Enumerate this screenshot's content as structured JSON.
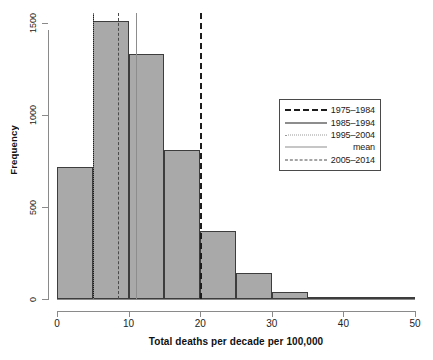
{
  "chart_data": {
    "type": "bar",
    "title": "",
    "subtitle": "",
    "xlabel": "Total deaths per decade per 100,000",
    "ylabel": "Frequency",
    "xlim": [
      0,
      50
    ],
    "ylim": [
      0,
      1550
    ],
    "grid": false,
    "bin_width": 5,
    "bin_edges": [
      0,
      5,
      10,
      15,
      20,
      25,
      30,
      35,
      40,
      45,
      50
    ],
    "categories": [
      "0-5",
      "5-10",
      "10-15",
      "15-20",
      "20-25",
      "25-30",
      "30-35",
      "35-40",
      "40-45",
      "45-50"
    ],
    "values": [
      720,
      1510,
      1330,
      810,
      370,
      140,
      40,
      12,
      4,
      1
    ],
    "bar_fill": "#a9a9a9",
    "bar_border": "#3d3d3d",
    "xticks": [
      0,
      10,
      20,
      30,
      40,
      50
    ],
    "xtick_labels": [
      "0",
      "10",
      "20",
      "30",
      "40",
      "50"
    ],
    "yticks": [
      0,
      500,
      1000,
      1500
    ],
    "ytick_labels": [
      "0",
      "500",
      "1000",
      "1500"
    ],
    "vlines": [
      {
        "name": "1975-1984",
        "x": 20.0,
        "style": "dashed-thick",
        "color": "#1c1c1c"
      },
      {
        "name": "1985-1994",
        "x": 5.0,
        "style": "solid-thick",
        "color": "#1c1c1c"
      },
      {
        "name": "1995-2004",
        "x": 5.0,
        "style": "dotted",
        "color": "#7a7a7a"
      },
      {
        "name": "mean",
        "x": 11.0,
        "style": "solid-thin",
        "color": "#8d8d8d"
      },
      {
        "name": "2005-2014",
        "x": 8.5,
        "style": "dashed-thin",
        "color": "#4a4a4a"
      }
    ],
    "legend_position": "center-right",
    "legend": [
      {
        "label": "1975–1984",
        "key": "dashed-thick"
      },
      {
        "label": "1985–1994",
        "key": "solid-thick"
      },
      {
        "label": "1995–2004",
        "key": "dotted"
      },
      {
        "label": "mean",
        "key": "solid-thin"
      },
      {
        "label": "2005–2014",
        "key": "dashed-thin"
      }
    ]
  }
}
